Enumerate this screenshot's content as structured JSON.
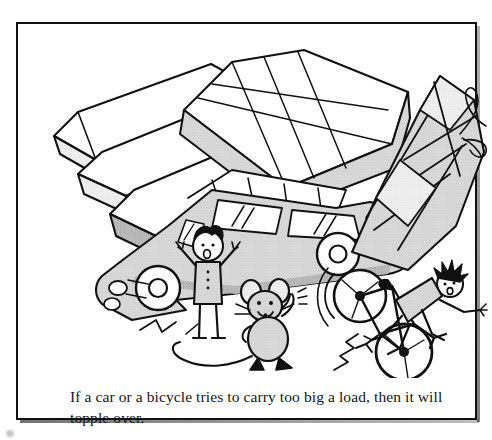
{
  "page": {
    "background_color": "#ffffff",
    "width": 492,
    "height": 440
  },
  "figure": {
    "frame": {
      "border_color": "#111111",
      "border_width": 2,
      "background_color": "#ffffff",
      "has_drop_shadow": true
    },
    "caption": {
      "text": "If a car or a bicycle tries to carry too big a load, then it will topple over.",
      "font_style": "serif",
      "color": "#151515"
    },
    "illustration": {
      "style": "black-and-white cartoon line drawing with gray halftone shading",
      "ink_color": "#111111",
      "shade_light": "#e3e3e3",
      "shade_mid": "#c9c9c9",
      "shade_dark": "#a8a8a8",
      "scenes": [
        {
          "name": "overloaded-car",
          "description": "A car tilted nose-down and tail-up, carrying three tiers of long flat boxes strapped to its roof rack; the stack overhangs far past the front of the car.",
          "elements": [
            "stacked-boxes-on-roof",
            "roof-rack",
            "car-body",
            "car-windows",
            "car-wheels",
            "headlight",
            "alarmed-person"
          ]
        },
        {
          "name": "alarmed-person",
          "description": "A small figure with spiky hair standing in front of the car, arms raised and mouth open in alarm, wearing a buttoned coat."
        },
        {
          "name": "observer-mouse",
          "description": "A cartoon mouse standing upright with big round ears, whiskers, a long curling tail and one paw raised to its head, watching the scene."
        },
        {
          "name": "toppling-bicycle",
          "description": "A bicycle tipping over backward under a tall stack of square boxes tied with string in a bow; the rider is flung backward off the seat with arms and legs out.",
          "elements": [
            "stacked-boxes-tied-with-string",
            "string-bow",
            "bicycle-frame",
            "bicycle-wheels",
            "falling-rider",
            "motion-lines"
          ]
        }
      ]
    }
  }
}
